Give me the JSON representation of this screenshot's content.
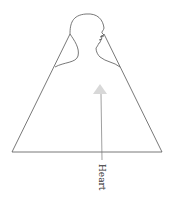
{
  "diagram": {
    "title": "",
    "arrow": {
      "label": "Heart",
      "color": "#d8d8d8"
    },
    "colors": {
      "outline": "#555555",
      "background": "#ffffff",
      "text": "#333333"
    }
  }
}
